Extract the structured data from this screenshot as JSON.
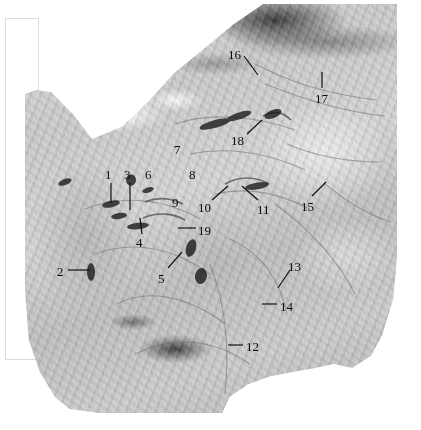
{
  "figure": {
    "kind": "anatomical-dissection-photograph",
    "colors": {
      "background": "#ffffff",
      "frame_border": "#dcdcdc",
      "label_text": "#0a0a0a",
      "leader_line": "#111111",
      "specimen_light": "#e8e8e8",
      "specimen_mid": "#c8c8c8",
      "specimen_dark": "#303030"
    }
  },
  "labels": [
    {
      "id": "1",
      "text": "1",
      "x": 105,
      "y": 168,
      "leader": {
        "type": "line",
        "x1": 111,
        "y1": 183,
        "x2": 111,
        "y2": 203
      }
    },
    {
      "id": "2",
      "text": "2",
      "x": 57,
      "y": 265,
      "leader": {
        "type": "line",
        "x1": 68,
        "y1": 270,
        "x2": 90,
        "y2": 270
      }
    },
    {
      "id": "3",
      "text": "3",
      "x": 124,
      "y": 168,
      "leader": {
        "type": "line",
        "x1": 130,
        "y1": 183,
        "x2": 130,
        "y2": 210
      }
    },
    {
      "id": "4",
      "text": "4",
      "x": 136,
      "y": 236,
      "leader": {
        "type": "line",
        "x1": 142,
        "y1": 234,
        "x2": 140,
        "y2": 218
      }
    },
    {
      "id": "5",
      "text": "5",
      "x": 158,
      "y": 272,
      "leader": {
        "type": "line",
        "x1": 168,
        "y1": 268,
        "x2": 182,
        "y2": 252
      }
    },
    {
      "id": "6",
      "text": "6",
      "x": 145,
      "y": 168,
      "leader": null
    },
    {
      "id": "7",
      "text": "7",
      "x": 174,
      "y": 143,
      "leader": null
    },
    {
      "id": "8",
      "text": "8",
      "x": 189,
      "y": 168,
      "leader": null
    },
    {
      "id": "9",
      "text": "9",
      "x": 172,
      "y": 196,
      "leader": null
    },
    {
      "id": "10",
      "text": "10",
      "x": 198,
      "y": 201,
      "leader": {
        "type": "line",
        "x1": 212,
        "y1": 200,
        "x2": 228,
        "y2": 186
      }
    },
    {
      "id": "11",
      "text": "11",
      "x": 257,
      "y": 203,
      "leader": {
        "type": "line",
        "x1": 258,
        "y1": 200,
        "x2": 242,
        "y2": 186
      }
    },
    {
      "id": "12",
      "text": "12",
      "x": 246,
      "y": 340,
      "leader": {
        "type": "line",
        "x1": 228,
        "y1": 345,
        "x2": 243,
        "y2": 345
      }
    },
    {
      "id": "13",
      "text": "13",
      "x": 288,
      "y": 260,
      "leader": {
        "type": "line",
        "x1": 290,
        "y1": 270,
        "x2": 278,
        "y2": 288
      }
    },
    {
      "id": "14",
      "text": "14",
      "x": 280,
      "y": 300,
      "leader": {
        "type": "line",
        "x1": 262,
        "y1": 304,
        "x2": 277,
        "y2": 304
      }
    },
    {
      "id": "15",
      "text": "15",
      "x": 301,
      "y": 200,
      "leader": {
        "type": "line",
        "x1": 312,
        "y1": 196,
        "x2": 326,
        "y2": 182
      }
    },
    {
      "id": "16",
      "text": "16",
      "x": 228,
      "y": 48,
      "leader": {
        "type": "line",
        "x1": 244,
        "y1": 56,
        "x2": 258,
        "y2": 75
      }
    },
    {
      "id": "17",
      "text": "17",
      "x": 315,
      "y": 92,
      "leader": {
        "type": "line",
        "x1": 322,
        "y1": 88,
        "x2": 322,
        "y2": 72
      }
    },
    {
      "id": "18",
      "text": "18",
      "x": 231,
      "y": 134,
      "leader": {
        "type": "line",
        "x1": 247,
        "y1": 134,
        "x2": 262,
        "y2": 120
      }
    },
    {
      "id": "19",
      "text": "19",
      "x": 198,
      "y": 224,
      "leader": {
        "type": "line",
        "x1": 178,
        "y1": 228,
        "x2": 196,
        "y2": 228
      }
    }
  ]
}
